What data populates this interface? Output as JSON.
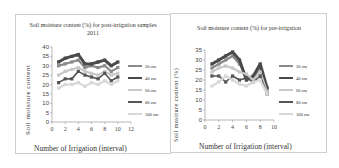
{
  "chart_data": [
    {
      "type": "line",
      "title": "Soil moisture content (%) for post-irrigation samples 2011",
      "xlabel": "Number of Irrigation (interval)",
      "ylabel": "Soil moisture content",
      "xlim": [
        0,
        12
      ],
      "ylim": [
        0,
        40
      ],
      "x_ticks": [
        0,
        2,
        4,
        6,
        8,
        10,
        12
      ],
      "y_ticks": [
        0,
        5,
        10,
        15,
        20,
        25,
        30,
        35,
        40
      ],
      "legend_position": "right",
      "grid": false,
      "x": [
        1,
        2,
        3,
        4,
        5,
        6,
        7,
        8,
        9,
        10
      ],
      "series": [
        {
          "name": "20 cm",
          "color": "#8a8a8a",
          "values": [
            30,
            31,
            32,
            33,
            29,
            30,
            29,
            30,
            27,
            29
          ]
        },
        {
          "name": "40 cm",
          "color": "#4a4a4a",
          "values": [
            32,
            34,
            35,
            36,
            31,
            31,
            32,
            33,
            30,
            32
          ]
        },
        {
          "name": "60 cm",
          "color": "#c8c8c8",
          "values": [
            25,
            27,
            28,
            29,
            27,
            26,
            25,
            27,
            25,
            26
          ]
        },
        {
          "name": "80 cm",
          "color": "#555555",
          "values": [
            21,
            23,
            23,
            27,
            25,
            24,
            23,
            26,
            22,
            24
          ]
        },
        {
          "name": "100 cm",
          "color": "#d8d8d8",
          "values": [
            18,
            20,
            20,
            21,
            19,
            21,
            20,
            22,
            20,
            22
          ]
        }
      ]
    },
    {
      "type": "line",
      "title": "Soil moisture content (%) for pre-irrigation",
      "xlabel": "Number of Irrigation (interval)",
      "ylabel": "Soil mositure content (%)",
      "xlim": [
        0,
        10
      ],
      "ylim": [
        0,
        35
      ],
      "x_ticks": [
        0,
        2,
        4,
        6,
        8,
        10
      ],
      "y_ticks": [
        0,
        5,
        10,
        15,
        20,
        25,
        30,
        35
      ],
      "legend_position": "right",
      "grid": false,
      "x": [
        1,
        2,
        3,
        4,
        5,
        6,
        7,
        8,
        9
      ],
      "series": [
        {
          "name": "20 cm",
          "color": "#8a8a8a",
          "values": [
            26,
            28,
            30,
            32,
            28,
            22,
            21,
            26,
            15
          ]
        },
        {
          "name": "40 cm",
          "color": "#4a4a4a",
          "values": [
            28,
            30,
            32,
            34,
            30,
            20,
            22,
            28,
            16
          ]
        },
        {
          "name": "60 cm",
          "color": "#c8c8c8",
          "values": [
            24,
            26,
            27,
            26,
            24,
            23,
            20,
            24,
            14
          ]
        },
        {
          "name": "80 cm",
          "color": "#555555",
          "values": [
            22,
            22,
            19,
            22,
            20,
            21,
            19,
            22,
            13
          ]
        },
        {
          "name": "100 cm",
          "color": "#d8d8d8",
          "values": [
            17,
            19,
            22,
            20,
            18,
            17,
            19,
            20,
            13
          ]
        }
      ]
    }
  ]
}
